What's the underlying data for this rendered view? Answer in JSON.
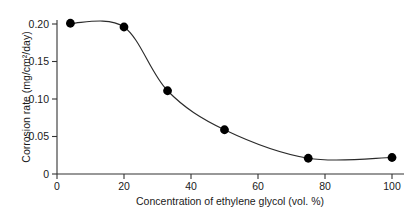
{
  "chart_data": {
    "type": "line",
    "title": "",
    "xlabel": "Concentration of ethylene glycol (vol. %)",
    "ylabel": "Corrosion rate (mg/cm²/day)",
    "xlim": [
      0,
      104
    ],
    "ylim": [
      0,
      0.215
    ],
    "grid": false,
    "legend": "none",
    "marker": "filled-circle",
    "x": [
      4,
      20,
      33,
      50,
      75,
      100
    ],
    "values": [
      0.201,
      0.196,
      0.111,
      0.059,
      0.021,
      0.022
    ],
    "series": [
      {
        "name": "Corrosion rate",
        "x": [
          4,
          20,
          33,
          50,
          75,
          100
        ],
        "values": [
          0.201,
          0.196,
          0.111,
          0.059,
          0.021,
          0.022
        ]
      }
    ],
    "xticks": [
      0,
      20,
      40,
      60,
      80,
      100
    ],
    "xticklabels": [
      "0",
      "20",
      "40",
      "60",
      "80",
      "100"
    ],
    "yticks": [
      0,
      0.05,
      0.1,
      0.15,
      0.2
    ],
    "yticklabels": [
      "0",
      "0.05",
      "0.10",
      "0.15",
      "0.20"
    ],
    "line_color": "#2b2b2b",
    "marker_color": "#000000",
    "axis_color": "#333333",
    "background_color": "#ffffff"
  }
}
